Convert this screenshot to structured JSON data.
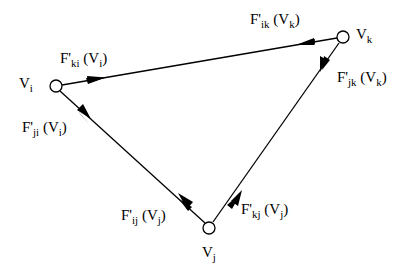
{
  "diagram": {
    "type": "triangle-graph",
    "nodes": [
      {
        "id": "vi",
        "name": "V",
        "sub": "i",
        "cx": 56,
        "cy": 86
      },
      {
        "id": "vk",
        "name": "V",
        "sub": "k",
        "cx": 343,
        "cy": 37
      },
      {
        "id": "vj",
        "name": "V",
        "sub": "j",
        "cx": 209,
        "cy": 228
      }
    ],
    "edges": [
      {
        "from": "vi",
        "to": "vk"
      },
      {
        "from": "vi",
        "to": "vj"
      },
      {
        "from": "vk",
        "to": "vj"
      }
    ],
    "forces": [
      {
        "id": "fki",
        "F": "F'",
        "fsub": "ki",
        "arg": "V",
        "argsub": "i",
        "at": "vi",
        "direction": "toward vk"
      },
      {
        "id": "fji",
        "F": "F'",
        "fsub": "ji",
        "arg": "V",
        "argsub": "i",
        "at": "vi",
        "direction": "toward vj"
      },
      {
        "id": "fik",
        "F": "F'",
        "fsub": "ik",
        "arg": "V",
        "argsub": "k",
        "at": "vk",
        "direction": "toward vi"
      },
      {
        "id": "fjk",
        "F": "F'",
        "fsub": "jk",
        "arg": "V",
        "argsub": "k",
        "at": "vk",
        "direction": "toward vj"
      },
      {
        "id": "fij",
        "F": "F'",
        "fsub": "ij",
        "arg": "V",
        "argsub": "j",
        "at": "vj",
        "direction": "toward vi"
      },
      {
        "id": "fkj",
        "F": "F'",
        "fsub": "kj",
        "arg": "V",
        "argsub": "j",
        "at": "vj",
        "direction": "toward vk"
      }
    ]
  },
  "labels": {
    "vi": {
      "main": "V",
      "sub": "i"
    },
    "vk": {
      "main": "V",
      "sub": "k"
    },
    "vj": {
      "main": "V",
      "sub": "j"
    },
    "fki": {
      "F": "F'",
      "fsub": "ki",
      "open": " (V",
      "argsub": "i",
      "close": ")"
    },
    "fji": {
      "F": "F'",
      "fsub": "ji",
      "open": " (V",
      "argsub": "i",
      "close": ")"
    },
    "fik": {
      "F": "F'",
      "fsub": "ik",
      "open": " (V",
      "argsub": "k",
      "close": ")"
    },
    "fjk": {
      "F": "F'",
      "fsub": "jk",
      "open": " (V",
      "argsub": "k",
      "close": ")"
    },
    "fij": {
      "F": "F'",
      "fsub": "ij",
      "open": " (V",
      "argsub": "j",
      "close": ")"
    },
    "fkj": {
      "F": "F'",
      "fsub": "kj",
      "open": " (V",
      "argsub": "j",
      "close": ")"
    }
  }
}
